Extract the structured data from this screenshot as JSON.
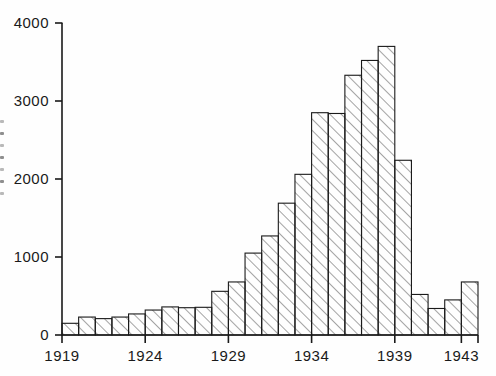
{
  "chart_data": {
    "type": "bar",
    "title": "",
    "subtitle": "",
    "xlabel": "",
    "ylabel": "",
    "categories": [
      1919,
      1920,
      1921,
      1922,
      1923,
      1924,
      1925,
      1926,
      1927,
      1928,
      1929,
      1930,
      1931,
      1932,
      1933,
      1934,
      1935,
      1936,
      1937,
      1938,
      1939,
      1940,
      1941,
      1942,
      1943
    ],
    "values": [
      150,
      230,
      210,
      230,
      270,
      320,
      360,
      350,
      355,
      560,
      680,
      1050,
      1270,
      1690,
      2060,
      2850,
      2840,
      3330,
      3520,
      3700,
      2240,
      520,
      340,
      450,
      680
    ],
    "xlim": [
      1919,
      1944
    ],
    "ylim": [
      0,
      4000
    ],
    "xticks": [
      "1919",
      "1924",
      "1929",
      "1934",
      "1939",
      "1943"
    ],
    "xtick_values": [
      1919,
      1924,
      1929,
      1934,
      1939,
      1943
    ],
    "yticks": [
      "0",
      "1000",
      "2000",
      "3000",
      "4000"
    ],
    "ytick_values": [
      0,
      1000,
      2000,
      3000,
      4000
    ],
    "grid": false,
    "legend": null,
    "bar_style": {
      "fill": "#ffffff",
      "edge": "#1a1a1a",
      "hatch": "diagonal-forward-slash",
      "hatch_color": "#555555"
    },
    "axis_color": "#1a1a1a",
    "background": "#fefefe"
  },
  "marks": {
    "scan_artifacts": [
      "mark",
      "mark",
      "mark",
      "mark",
      "mark",
      "mark",
      "mark"
    ]
  }
}
